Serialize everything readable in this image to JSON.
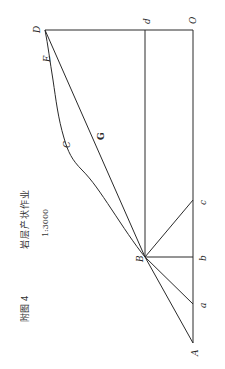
{
  "figure": {
    "number_label": "附图 4",
    "title": "岩层产状作业",
    "scale": "1:3000"
  },
  "points": {
    "A": {
      "label": "A",
      "x": 193,
      "y": 343
    },
    "a": {
      "label": "a",
      "x": 193,
      "y": 304
    },
    "B": {
      "label": "B",
      "x": 145,
      "y": 257
    },
    "b": {
      "label": "b",
      "x": 193,
      "y": 257
    },
    "c": {
      "label": "c",
      "x": 193,
      "y": 200
    },
    "C": {
      "label": "C",
      "x": 68,
      "y": 135
    },
    "G": {
      "label": "G",
      "x": 100,
      "y": 135
    },
    "E": {
      "label": "E",
      "x": 47,
      "y": 55
    },
    "D": {
      "label": "D",
      "x": 45,
      "y": 30
    },
    "d": {
      "label": "d",
      "x": 145,
      "y": 30
    },
    "O": {
      "label": "O",
      "x": 193,
      "y": 30
    }
  },
  "colors": {
    "line": "#2a2a2a",
    "text": "#333333"
  }
}
